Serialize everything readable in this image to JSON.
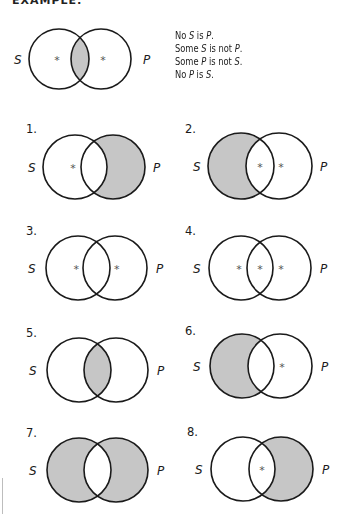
{
  "header": {
    "title": "EXAMPLE:"
  },
  "colors": {
    "shade": "#c6c6c6",
    "stroke": "#1a1a1a",
    "background": "#ffffff"
  },
  "example": {
    "diagram": {
      "id": "example",
      "number": "",
      "cx_s": 59,
      "cx_p": 101,
      "cy": 59,
      "r": 30,
      "label_s": "S",
      "label_p": "P",
      "label_s_x": 14,
      "label_p_x": 143,
      "shaded": [
        "middle"
      ],
      "stars": [
        "left",
        "right"
      ]
    },
    "statements": [
      {
        "parts": [
          "No ",
          "S",
          " is ",
          "P",
          "."
        ]
      },
      {
        "parts": [
          "Some ",
          "S",
          " is not ",
          "P",
          "."
        ]
      },
      {
        "parts": [
          "Some ",
          "P",
          " is not ",
          "S",
          "."
        ]
      },
      {
        "parts": [
          "No ",
          "P",
          " is ",
          "S",
          "."
        ]
      }
    ]
  },
  "exercises": [
    {
      "id": "1",
      "number": "1.",
      "num_x": 26,
      "num_y": 133,
      "cx_s": 75,
      "cx_p": 113,
      "cy": 167,
      "r": 32,
      "label_s": "S",
      "label_p": "P",
      "label_s_x": 28,
      "label_p_x": 153,
      "shaded": [
        "right"
      ],
      "stars": [
        "left"
      ]
    },
    {
      "id": "2",
      "number": "2.",
      "num_x": 185,
      "num_y": 133,
      "cx_s": 241,
      "cx_p": 279,
      "cy": 166,
      "r": 33,
      "label_s": "S",
      "label_p": "P",
      "label_s_x": 193,
      "label_p_x": 320,
      "shaded": [
        "left"
      ],
      "stars": [
        "middle",
        "right"
      ]
    },
    {
      "id": "3",
      "number": "3.",
      "num_x": 26,
      "num_y": 235,
      "cx_s": 78,
      "cx_p": 115,
      "cy": 268,
      "r": 32,
      "label_s": "S",
      "label_p": "P",
      "label_s_x": 28,
      "label_p_x": 156,
      "shaded": [],
      "stars": [
        "left",
        "right"
      ]
    },
    {
      "id": "4",
      "number": "4.",
      "num_x": 185,
      "num_y": 235,
      "cx_s": 241,
      "cx_p": 279,
      "cy": 268,
      "r": 32,
      "label_s": "S",
      "label_p": "P",
      "label_s_x": 193,
      "label_p_x": 320,
      "shaded": [],
      "stars": [
        "left",
        "middle",
        "right"
      ]
    },
    {
      "id": "5",
      "number": "5.",
      "num_x": 26,
      "num_y": 337,
      "cx_s": 79,
      "cx_p": 116,
      "cy": 370,
      "r": 32,
      "label_s": "S",
      "label_p": "P",
      "label_s_x": 29,
      "label_p_x": 157,
      "shaded": [
        "middle"
      ],
      "stars": []
    },
    {
      "id": "6",
      "number": "6.",
      "num_x": 185,
      "num_y": 335,
      "cx_s": 242,
      "cx_p": 280,
      "cy": 366,
      "r": 32,
      "label_s": "S",
      "label_p": "P",
      "label_s_x": 193,
      "label_p_x": 321,
      "shaded": [
        "left"
      ],
      "stars": [
        "right"
      ]
    },
    {
      "id": "7",
      "number": "7.",
      "num_x": 26,
      "num_y": 437,
      "cx_s": 79,
      "cx_p": 116,
      "cy": 470,
      "r": 32,
      "label_s": "S",
      "label_p": "P",
      "label_s_x": 29,
      "label_p_x": 157,
      "shaded": [
        "left",
        "right"
      ],
      "stars": []
    },
    {
      "id": "8",
      "number": "8.",
      "num_x": 187,
      "num_y": 436,
      "cx_s": 243,
      "cx_p": 281,
      "cy": 469,
      "r": 32,
      "label_s": "S",
      "label_p": "P",
      "label_s_x": 195,
      "label_p_x": 322,
      "shaded": [
        "right"
      ],
      "stars": [
        "middle"
      ]
    }
  ]
}
